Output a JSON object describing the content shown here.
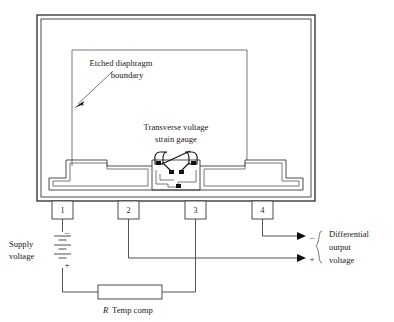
{
  "diagram": {
    "annotations": {
      "diaphragm_label_line1": "Etched  diaphragm",
      "diaphragm_label_line2": "boundary",
      "gauge_label_line1": "Transverse voltage",
      "gauge_label_line2": "strain gauge"
    },
    "terminals": [
      {
        "id": "terminal-1",
        "number": "1"
      },
      {
        "id": "terminal-2",
        "number": "2"
      },
      {
        "id": "terminal-3",
        "number": "3"
      },
      {
        "id": "terminal-4",
        "number": "4"
      }
    ],
    "supply": {
      "label_line1": "Supply",
      "label_line2": "voltage",
      "negative_sign": "–",
      "positive_sign": "+"
    },
    "output": {
      "label_line1": "Differential",
      "label_line2": "output",
      "label_line3": "voltage",
      "negative_sign": "–",
      "positive_sign": "+"
    },
    "resistor": {
      "symbol": "R",
      "label": "Temp comp"
    },
    "colors": {
      "line": "#3a3a3a",
      "outline": "#2b2b2b",
      "pad": "#111111",
      "text": "#1a1a1a",
      "background": "#ffffff"
    }
  }
}
